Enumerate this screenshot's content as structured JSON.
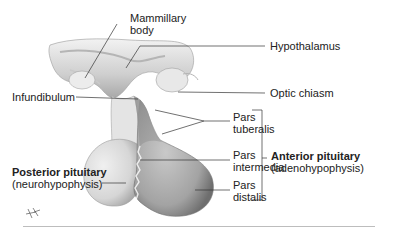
{
  "diagram": {
    "labels": {
      "mammillary_body": [
        "Mammillary",
        "body"
      ],
      "hypothalamus": "Hypothalamus",
      "optic_chiasm": "Optic chiasm",
      "infundibulum": "Infundibulum",
      "pars_tuberalis": [
        "Pars",
        "tuberalis"
      ],
      "pars_intermedia": [
        "Pars",
        "intermedia"
      ],
      "pars_distalis": [
        "Pars",
        "distalis"
      ],
      "anterior_pituitary": {
        "name": "Anterior pituitary",
        "alt": "(adenohypophysis)"
      },
      "posterior_pituitary": {
        "name": "Posterior pituitary",
        "alt": "(neurohypophysis)"
      }
    },
    "colors": {
      "tissue_light": "#e6e6e6",
      "tissue_mid": "#c4c4c4",
      "tissue_dark": "#8f8f8f",
      "leader_line": "#333333"
    }
  }
}
